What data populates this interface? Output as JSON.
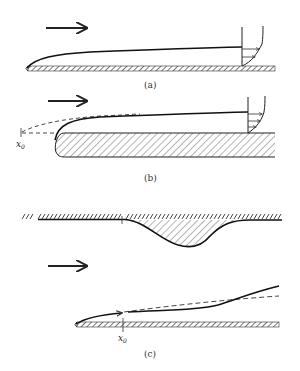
{
  "figure": {
    "panels": [
      {
        "id": "a",
        "caption": "(a)",
        "description": "Laminar boundary layer on thin flat plate with velocity profile"
      },
      {
        "id": "b",
        "caption": "(b)",
        "description": "Boundary layer on thick plate with rounded leading edge, virtual origin x0",
        "origin_label": "x",
        "origin_sub": "0"
      },
      {
        "id": "c",
        "caption": "(c)",
        "description": "Boundary layer on flat plate with opposite wall bump; virtual origin x0",
        "origin_label": "x",
        "origin_sub": "0"
      }
    ],
    "flow_direction": "left-to-right",
    "colors": {
      "line": "#1a1a1a",
      "hatch": "#333333",
      "background": "#ffffff"
    }
  }
}
